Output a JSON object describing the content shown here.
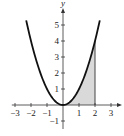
{
  "chart_data": {
    "type": "line",
    "title": "",
    "function": "y = x^2",
    "xlabel": "x",
    "ylabel": "y",
    "xlim": [
      -3.2,
      3.5
    ],
    "ylim": [
      -1.5,
      6
    ],
    "x_ticks": [
      -3,
      -2,
      -1,
      1,
      2,
      3
    ],
    "y_ticks": [
      -1,
      1,
      2,
      3,
      4,
      5
    ],
    "x_tick_labels": [
      "−3",
      "−2",
      "−1",
      "1",
      "2",
      "3"
    ],
    "y_tick_labels": [
      "−1",
      "1",
      "2",
      "3",
      "4",
      "5"
    ],
    "series": [
      {
        "name": "y = x^2",
        "x": [
          -2.3,
          -2,
          -1.5,
          -1,
          -0.5,
          0,
          0.5,
          1,
          1.5,
          2,
          2.3
        ],
        "y": [
          5.29,
          4,
          2.25,
          1,
          0.25,
          0,
          0.25,
          1,
          2.25,
          4,
          5.29
        ]
      }
    ],
    "shaded_region": {
      "from_x": 0,
      "to_x": 2,
      "under": "y = x^2",
      "color": "#d9d9d9"
    },
    "grid": false,
    "legend": null
  }
}
